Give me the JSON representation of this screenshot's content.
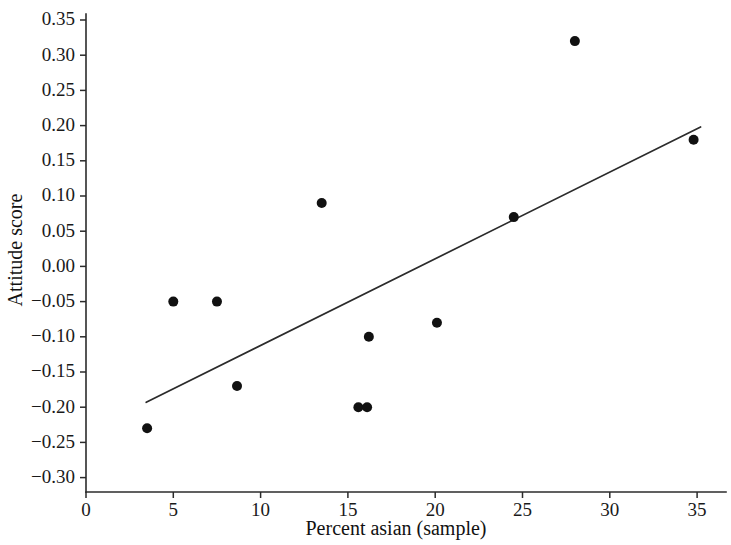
{
  "chart_data": {
    "type": "scatter",
    "title": "",
    "xlabel": "Percent asian (sample)",
    "ylabel": "Attitude score",
    "xlim": [
      0,
      36.5
    ],
    "ylim": [
      -0.325,
      0.3675
    ],
    "grid": false,
    "legend": null,
    "x_ticks": [
      0,
      5,
      10,
      15,
      20,
      25,
      30,
      35
    ],
    "x_tick_labels": [
      "0",
      "5",
      "10",
      "15",
      "20",
      "25",
      "30",
      "35"
    ],
    "y_ticks": [
      -0.3,
      -0.25,
      -0.2,
      -0.15,
      -0.1,
      -0.05,
      0.0,
      0.05,
      0.1,
      0.15,
      0.2,
      0.25,
      0.3,
      0.35
    ],
    "y_tick_labels": [
      "−0.30",
      "−0.25",
      "−0.20",
      "−0.15",
      "−0.10",
      "−0.05",
      "0.00",
      "0.05",
      "0.10",
      "0.15",
      "0.20",
      "0.25",
      "0.30",
      "0.35"
    ],
    "points": [
      {
        "x": 3.5,
        "y": -0.23
      },
      {
        "x": 5.0,
        "y": -0.05
      },
      {
        "x": 7.5,
        "y": -0.05
      },
      {
        "x": 8.65,
        "y": -0.17
      },
      {
        "x": 13.5,
        "y": 0.09
      },
      {
        "x": 15.6,
        "y": -0.2
      },
      {
        "x": 16.1,
        "y": -0.2
      },
      {
        "x": 16.2,
        "y": -0.1
      },
      {
        "x": 20.1,
        "y": -0.08
      },
      {
        "x": 24.5,
        "y": 0.07
      },
      {
        "x": 28.0,
        "y": 0.32
      },
      {
        "x": 34.8,
        "y": 0.18
      }
    ],
    "trend_line": {
      "x_start": 3.45,
      "y_start": -0.193,
      "x_end": 35.2,
      "y_end": 0.198
    },
    "marker": {
      "shape": "circle",
      "radius_px": 5,
      "color": "#111111"
    },
    "line_color": "#2b2b2b",
    "background_color": "#ffffff"
  }
}
